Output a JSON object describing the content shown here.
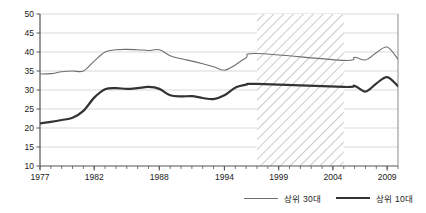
{
  "chart_data": {
    "type": "line",
    "title": "",
    "xlabel": "",
    "ylabel": "",
    "xlim": [
      1977,
      2010
    ],
    "ylim": [
      10,
      50
    ],
    "ytick_step": 5,
    "yticks": [
      10,
      15,
      20,
      25,
      30,
      35,
      40,
      45,
      50
    ],
    "xticks_labeled": [
      1977,
      1982,
      1988,
      1994,
      1999,
      2004,
      2009
    ],
    "xtick_minor_every": 1,
    "grid": "horizontal",
    "legend_position": "bottom-right",
    "shaded_gap": {
      "label": "",
      "x_start": 1997.0,
      "x_end": 2005.0,
      "style": "diagonal-hatch"
    },
    "series": [
      {
        "name": "상위 30대",
        "color": "#6e6e6e",
        "width": 1.1,
        "x": [
          1977,
          1978,
          1979,
          1980,
          1981,
          1982,
          1983,
          1984,
          1985,
          1986,
          1987,
          1988,
          1989,
          1990,
          1991,
          1992,
          1993,
          1994,
          1995,
          1996,
          1997,
          2005,
          2006,
          2007,
          2008,
          2009,
          2010
        ],
        "values": [
          34.2,
          34.3,
          34.8,
          35.0,
          35.0,
          37.6,
          40.0,
          40.6,
          40.7,
          40.6,
          40.4,
          40.6,
          39.0,
          38.2,
          37.6,
          36.9,
          36.1,
          35.2,
          36.6,
          38.5,
          39.6,
          37.8,
          38.6,
          37.9,
          39.8,
          41.3,
          38.1
        ]
      },
      {
        "name": "상위 10대",
        "color": "#333333",
        "width": 2.2,
        "x": [
          1977,
          1978,
          1979,
          1980,
          1981,
          1982,
          1983,
          1984,
          1985,
          1986,
          1987,
          1988,
          1989,
          1990,
          1991,
          1992,
          1993,
          1994,
          1995,
          1996,
          1997,
          2005,
          2006,
          2007,
          2008,
          2009,
          2010
        ],
        "values": [
          21.2,
          21.6,
          22.1,
          22.7,
          24.5,
          28.0,
          30.2,
          30.5,
          30.3,
          30.5,
          30.8,
          30.3,
          28.6,
          28.3,
          28.4,
          27.9,
          27.6,
          28.6,
          30.6,
          31.4,
          31.6,
          30.8,
          31.1,
          29.6,
          31.7,
          33.4,
          31.0
        ]
      }
    ]
  },
  "legend": {
    "items": [
      {
        "label": "상위 30대"
      },
      {
        "label": "상위 10대"
      }
    ]
  },
  "axis": {
    "y_labels": [
      "50",
      "45",
      "40",
      "35",
      "30",
      "25",
      "20",
      "15",
      "10"
    ],
    "x_labels": [
      "1977",
      "1982",
      "1988",
      "1994",
      "1999",
      "2004",
      "2009"
    ]
  },
  "colors": {
    "series_top30": "#6e6e6e",
    "series_top10": "#333333",
    "grid": "#d9d9d9",
    "axis": "#555555",
    "hatch": "#b8b8b8",
    "text": "#1a1a1a"
  }
}
